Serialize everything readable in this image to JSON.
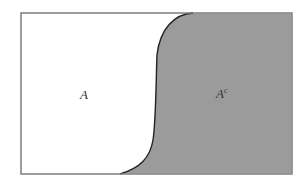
{
  "diagram": {
    "type": "venn-complement",
    "universe_label": "",
    "regions": [
      {
        "id": "A",
        "label": "A",
        "fill": "#ffffff"
      },
      {
        "id": "Ac",
        "label": "A",
        "superscript": "c",
        "fill": "#9b9b9b"
      }
    ],
    "border_color": "#8a8a8a",
    "curve_color": "#222222"
  }
}
